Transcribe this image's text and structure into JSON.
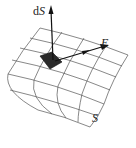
{
  "figure": {
    "labels": {
      "normal_vector": "dS",
      "normal_vector_prefix": "d",
      "normal_vector_symbol": "S",
      "field_vector": "E",
      "surface": "S"
    },
    "colors": {
      "grid_line": "#555555",
      "patch_fill": "#2a2a2a",
      "arrow": "#111111",
      "text": "#222222",
      "background": "#ffffff"
    },
    "grid": {
      "rows": 5,
      "cols": 4
    },
    "caption": ""
  }
}
